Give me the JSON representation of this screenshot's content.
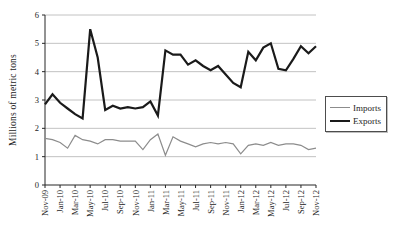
{
  "figure": {
    "background": "#ffffff",
    "grid_color": "#b3b3b3",
    "axis_color": "#262626",
    "text_color": "#262626"
  },
  "chart_data": {
    "type": "line",
    "title": "",
    "xlabel": "",
    "ylabel": "Millions of metric tons",
    "ylim": [
      0,
      6
    ],
    "yticks": [
      0,
      1,
      2,
      3,
      4,
      5,
      6
    ],
    "grid": "horizontal",
    "xtick_step": 2,
    "legend_position": "right",
    "legend_border": true,
    "categories": [
      "Nov-09",
      "Dec-09",
      "Jan-10",
      "Feb-10",
      "Mar-10",
      "Apr-10",
      "May-10",
      "Jun-10",
      "Jul-10",
      "Aug-10",
      "Sep-10",
      "Oct-10",
      "Nov-10",
      "Dec-10",
      "Jan-11",
      "Feb-11",
      "Mar-11",
      "Apr-11",
      "May-11",
      "Jun-11",
      "Jul-11",
      "Aug-11",
      "Sep-11",
      "Oct-11",
      "Nov-11",
      "Dec-11",
      "Jan-12",
      "Feb-12",
      "Mar-12",
      "Apr-12",
      "May-12",
      "Jun-12",
      "Jul-12",
      "Aug-12",
      "Sep-12",
      "Oct-12",
      "Nov-12"
    ],
    "xtick_labels": [
      "Nov-09",
      "Jan-10",
      "Mar-10",
      "May-10",
      "Jul-10",
      "Sep-10",
      "Nov-10",
      "Jan-11",
      "Mar-11",
      "May-11",
      "Jul-11",
      "Sep-11",
      "Nov-11",
      "Jan-12",
      "Mar-12",
      "May-12",
      "Jul-12",
      "Sep-12",
      "Nov-12"
    ],
    "series": [
      {
        "name": "Imports",
        "color": "#8c8c8c",
        "stroke_width": 1.2,
        "values": [
          1.65,
          1.6,
          1.5,
          1.3,
          1.75,
          1.6,
          1.55,
          1.45,
          1.6,
          1.6,
          1.55,
          1.55,
          1.55,
          1.25,
          1.6,
          1.8,
          1.05,
          1.7,
          1.55,
          1.45,
          1.35,
          1.45,
          1.5,
          1.45,
          1.5,
          1.45,
          1.1,
          1.4,
          1.45,
          1.4,
          1.5,
          1.4,
          1.45,
          1.45,
          1.4,
          1.25,
          1.3
        ]
      },
      {
        "name": "Exports",
        "color": "#1a1a1a",
        "stroke_width": 2.2,
        "values": [
          2.85,
          3.2,
          2.9,
          2.7,
          2.5,
          2.35,
          5.5,
          4.5,
          2.65,
          2.8,
          2.7,
          2.75,
          2.7,
          2.75,
          2.95,
          2.45,
          4.75,
          4.6,
          4.6,
          4.25,
          4.4,
          4.2,
          4.05,
          4.2,
          3.9,
          3.6,
          3.45,
          4.7,
          4.4,
          4.85,
          5.0,
          4.1,
          4.05,
          4.45,
          4.9,
          4.65,
          4.9
        ]
      }
    ]
  }
}
